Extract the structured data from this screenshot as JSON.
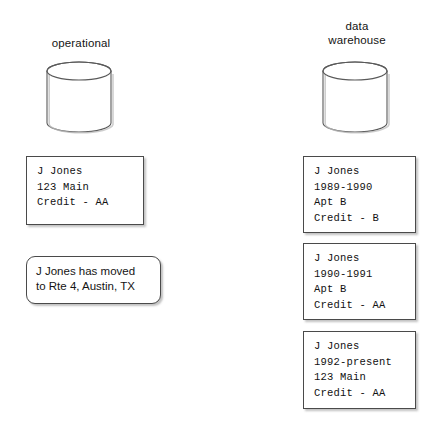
{
  "diagram": {
    "background_color": "#ffffff",
    "line_color": "#4a4a4a",
    "text_color": "#141414",
    "columns": [
      {
        "id": "operational",
        "caption": "operational",
        "store_icon": "database-cylinder-icon"
      },
      {
        "id": "data-warehouse",
        "caption": "data\nwarehouse",
        "store_icon": "database-cylinder-icon"
      }
    ],
    "operational": {
      "record": {
        "lines": [
          "J Jones",
          "123 Main",
          "Credit - AA"
        ],
        "text": "J Jones\n123 Main\nCredit - AA"
      },
      "message": {
        "lines": [
          "J Jones has moved",
          "to Rte 4, Austin, TX"
        ],
        "text": "J Jones has moved\nto Rte 4, Austin, TX"
      }
    },
    "warehouse": {
      "records": [
        {
          "lines": [
            "J Jones",
            "1989-1990",
            "Apt B",
            "Credit - B"
          ],
          "text": "J Jones\n1989-1990\nApt B\nCredit - B"
        },
        {
          "lines": [
            "J Jones",
            "1990-1991",
            "Apt B",
            "Credit - AA"
          ],
          "text": "J Jones\n1990-1991\nApt B\nCredit - AA"
        },
        {
          "lines": [
            "J Jones",
            "1992-present",
            "123 Main",
            "Credit - AA"
          ],
          "text": "J Jones\n1992-present\n123 Main\nCredit - AA"
        }
      ]
    }
  }
}
